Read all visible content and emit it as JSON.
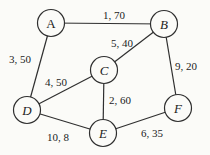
{
  "figure": {
    "background_color": "#fbfbf8",
    "line_color": "#2f2f2f",
    "text_color": "#1c1c1c"
  },
  "graph": {
    "nodes": [
      {
        "id": "A",
        "label": "A",
        "x": 51,
        "y": 23
      },
      {
        "id": "B",
        "label": "B",
        "x": 164,
        "y": 24
      },
      {
        "id": "C",
        "label": "C",
        "x": 104,
        "y": 70
      },
      {
        "id": "D",
        "label": "D",
        "x": 27,
        "y": 110
      },
      {
        "id": "E",
        "label": "E",
        "x": 103,
        "y": 133
      },
      {
        "id": "F",
        "label": "F",
        "x": 178,
        "y": 108
      }
    ],
    "edges": [
      {
        "from": "A",
        "to": "B",
        "label": "1, 70",
        "lx": 114,
        "ly": 19
      },
      {
        "from": "A",
        "to": "D",
        "label": "3, 50",
        "lx": 20,
        "ly": 63
      },
      {
        "from": "B",
        "to": "C",
        "label": "5, 40",
        "lx": 122,
        "ly": 47
      },
      {
        "from": "B",
        "to": "F",
        "label": "9, 20",
        "lx": 186,
        "ly": 70
      },
      {
        "from": "C",
        "to": "D",
        "label": "4, 50",
        "lx": 56,
        "ly": 86
      },
      {
        "from": "C",
        "to": "E",
        "label": "2, 60",
        "lx": 120,
        "ly": 104
      },
      {
        "from": "D",
        "to": "E",
        "label": "10, 8",
        "lx": 58,
        "ly": 141
      },
      {
        "from": "E",
        "to": "F",
        "label": "6, 35",
        "lx": 152,
        "ly": 137
      }
    ]
  }
}
